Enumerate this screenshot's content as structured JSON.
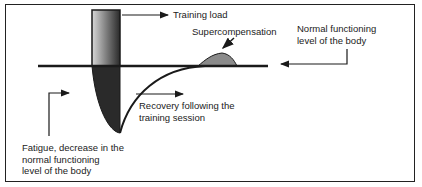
{
  "diagram": {
    "type": "supercompensation-cycle",
    "labels": {
      "training_load": "Training load",
      "supercompensation": "Supercompensation",
      "normal_level": [
        "Normal functioning",
        "level of the body"
      ],
      "recovery": [
        "Recovery following the",
        "training session"
      ],
      "fatigue": [
        "Fatigue, decrease in the",
        "normal functioning",
        "level of the body"
      ]
    },
    "colors": {
      "line": "#1a1a1a",
      "fatigue_fill": "#2a2a2a",
      "supercompensation_fill": "#8a8a8a",
      "text": "#222222"
    }
  }
}
